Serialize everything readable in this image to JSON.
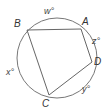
{
  "diagram": {
    "type": "inscribed-quadrilateral",
    "circle": {
      "cx": 57,
      "cy": 58,
      "r": 40,
      "stroke": "#777777"
    },
    "quad_stroke": "#666666",
    "vertices": [
      {
        "id": "B",
        "label": "B",
        "x": 27,
        "y": 30
      },
      {
        "id": "A",
        "label": "A",
        "x": 81,
        "y": 29
      },
      {
        "id": "D",
        "label": "D",
        "x": 92,
        "y": 62
      },
      {
        "id": "C",
        "label": "C",
        "x": 49,
        "y": 95
      }
    ],
    "arcs": [
      {
        "id": "w",
        "label": "w°",
        "between": "B-A"
      },
      {
        "id": "z",
        "label": "z°",
        "between": "A-D"
      },
      {
        "id": "y",
        "label": "y°",
        "between": "D-C"
      },
      {
        "id": "x",
        "label": "x°",
        "between": "C-B"
      }
    ]
  }
}
